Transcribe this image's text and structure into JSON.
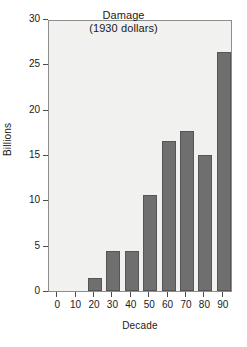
{
  "chart_data": {
    "type": "bar",
    "title": "Damage",
    "subtitle": "(1930 dollars)",
    "xlabel": "Decade",
    "ylabel": "Billions",
    "categories": [
      "0",
      "10",
      "20",
      "30",
      "40",
      "50",
      "60",
      "70",
      "80",
      "90"
    ],
    "values": [
      0,
      0,
      1.4,
      4.4,
      4.4,
      10.6,
      16.6,
      17.7,
      15.0,
      26.4
    ],
    "xlim": [
      -5,
      95
    ],
    "ylim": [
      0,
      30
    ],
    "xticks": [
      "0",
      "10",
      "20",
      "30",
      "40",
      "50",
      "60",
      "70",
      "80",
      "90"
    ],
    "yticks": [
      "0",
      "5",
      "10",
      "15",
      "20",
      "25",
      "30"
    ],
    "grid": false,
    "legend": "none",
    "bar_color": "#6f6f6f",
    "plot_background": "#f1f1ef",
    "axis_color": "#8d8d8d"
  }
}
